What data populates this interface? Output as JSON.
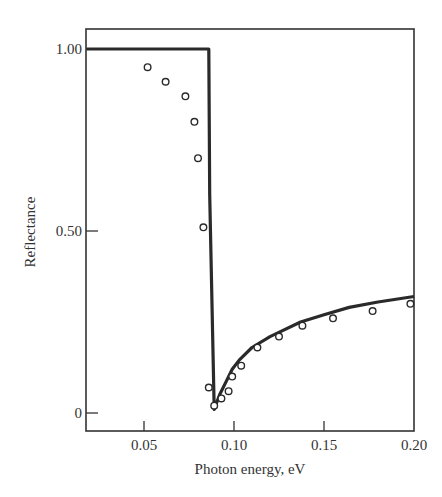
{
  "chart_data": {
    "type": "line",
    "title": "",
    "xlabel": "Photon energy, eV",
    "ylabel": "Reflectance",
    "xlim": [
      0.018,
      0.2
    ],
    "ylim": [
      -0.05,
      1.05
    ],
    "grid": false,
    "legend": null,
    "x_ticks": [
      {
        "value": 0.05,
        "label": "0.05"
      },
      {
        "value": 0.1,
        "label": "0.10"
      },
      {
        "value": 0.15,
        "label": "0.15"
      },
      {
        "value": 0.2,
        "label": "0.20"
      }
    ],
    "y_ticks": [
      {
        "value": 0,
        "label": "0"
      },
      {
        "value": 0.5,
        "label": "0.50"
      },
      {
        "value": 1.0,
        "label": "1.00"
      }
    ],
    "series": [
      {
        "name": "theory",
        "style": "solid-line",
        "x": [
          0.018,
          0.086,
          0.0865,
          0.089,
          0.092,
          0.095,
          0.099,
          0.103,
          0.11,
          0.12,
          0.137,
          0.15,
          0.164,
          0.18,
          0.2
        ],
        "y": [
          1.0,
          1.0,
          0.6,
          0.01,
          0.05,
          0.08,
          0.12,
          0.146,
          0.18,
          0.21,
          0.25,
          0.27,
          0.29,
          0.305,
          0.32
        ]
      },
      {
        "name": "experiment",
        "style": "open-circles",
        "x": [
          0.052,
          0.062,
          0.073,
          0.078,
          0.08,
          0.083,
          0.086,
          0.089,
          0.093,
          0.097,
          0.099,
          0.104,
          0.113,
          0.125,
          0.138,
          0.155,
          0.177,
          0.198
        ],
        "y": [
          0.95,
          0.91,
          0.87,
          0.8,
          0.7,
          0.51,
          0.07,
          0.02,
          0.04,
          0.06,
          0.1,
          0.13,
          0.18,
          0.21,
          0.24,
          0.26,
          0.28,
          0.3
        ]
      }
    ]
  }
}
